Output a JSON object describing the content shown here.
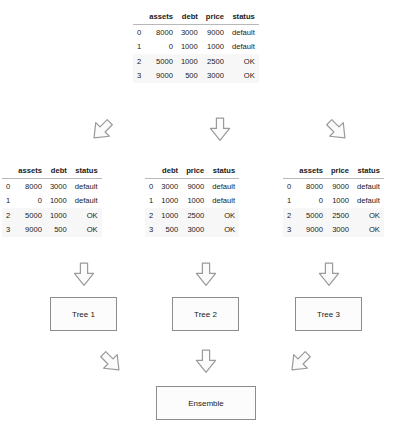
{
  "diagram": {
    "arrow_fill": "#fbfbfb",
    "arrow_stroke": "#9a9a9a",
    "box_border": "#8c8c8c",
    "rule_color": "#b8b8b8"
  },
  "tables": {
    "master": {
      "index_header": "",
      "columns": [
        "assets",
        "debt",
        "price",
        "status"
      ],
      "index": [
        "0",
        "1",
        "2",
        "3"
      ],
      "rows": [
        [
          "8000",
          "3000",
          "9000",
          "default"
        ],
        [
          "0",
          "1000",
          "1000",
          "default"
        ],
        [
          "5000",
          "1000",
          "2500",
          "OK"
        ],
        [
          "9000",
          "500",
          "3000",
          "OK"
        ]
      ]
    },
    "sub_1": {
      "index_header": "",
      "columns": [
        "assets",
        "debt",
        "status"
      ],
      "index": [
        "0",
        "1",
        "2",
        "3"
      ],
      "rows": [
        [
          "8000",
          "3000",
          "default"
        ],
        [
          "0",
          "1000",
          "default"
        ],
        [
          "5000",
          "1000",
          "OK"
        ],
        [
          "9000",
          "500",
          "OK"
        ]
      ]
    },
    "sub_2": {
      "index_header": "",
      "columns": [
        "debt",
        "price",
        "status"
      ],
      "index": [
        "0",
        "1",
        "2",
        "3"
      ],
      "rows": [
        [
          "3000",
          "9000",
          "default"
        ],
        [
          "1000",
          "1000",
          "default"
        ],
        [
          "1000",
          "2500",
          "OK"
        ],
        [
          "500",
          "3000",
          "OK"
        ]
      ]
    },
    "sub_3": {
      "index_header": "",
      "columns": [
        "assets",
        "price",
        "status"
      ],
      "index": [
        "0",
        "1",
        "2",
        "3"
      ],
      "rows": [
        [
          "8000",
          "9000",
          "default"
        ],
        [
          "0",
          "1000",
          "default"
        ],
        [
          "5000",
          "2500",
          "OK"
        ],
        [
          "9000",
          "3000",
          "OK"
        ]
      ]
    }
  },
  "nodes": {
    "tree_1": "Tree 1",
    "tree_2": "Tree 2",
    "tree_3": "Tree 3",
    "ensemble": "Ensemble"
  },
  "arrows": {
    "split_left": "down-left-block-arrow",
    "split_mid": "down-block-arrow",
    "split_right": "down-right-block-arrow",
    "to_tree_1": "down-block-arrow",
    "to_tree_2": "down-block-arrow",
    "to_tree_3": "down-block-arrow",
    "merge_left": "down-right-block-arrow",
    "merge_mid": "down-block-arrow",
    "merge_right": "down-left-block-arrow"
  }
}
